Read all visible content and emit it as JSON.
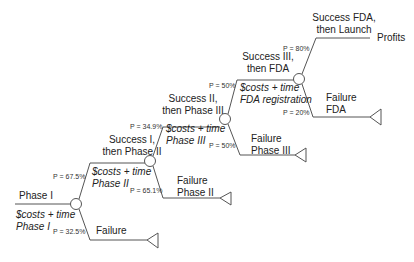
{
  "root": {
    "label": "Phase I",
    "cost": [
      "$costs + time",
      "Phase I"
    ]
  },
  "nodes": [
    {
      "id": "phase1",
      "success_p": "P = 67.5%",
      "failure_p": "P = 32.5%",
      "success_label": [
        "Success I,",
        "then Phase II"
      ],
      "failure_label": [
        "Failure"
      ],
      "cost": [
        "$costs + time",
        "Phase II"
      ]
    },
    {
      "id": "phase2",
      "success_p": "P = 34.9%",
      "failure_p": "P = 65.1%",
      "success_label": [
        "Success II,",
        "then Phase III"
      ],
      "failure_label": [
        "Failure",
        "Phase II"
      ],
      "cost": [
        "$costs + time",
        "Phase III"
      ]
    },
    {
      "id": "phase3",
      "success_p": "P = 50%",
      "failure_p": "P = 50%",
      "success_label": [
        "Success III,",
        "then FDA"
      ],
      "failure_label": [
        "Failure",
        "Phase III"
      ],
      "cost": [
        "$costs + time",
        "FDA registration"
      ]
    },
    {
      "id": "fda",
      "success_p": "P = 80%",
      "failure_p": "P = 20%",
      "success_label": [
        "Success FDA,",
        "then Launch"
      ],
      "failure_label": [
        "Failure",
        "FDA"
      ]
    }
  ],
  "outcome": {
    "label": "Profits"
  },
  "colors": {
    "line": "#555555",
    "text": "#222222"
  }
}
